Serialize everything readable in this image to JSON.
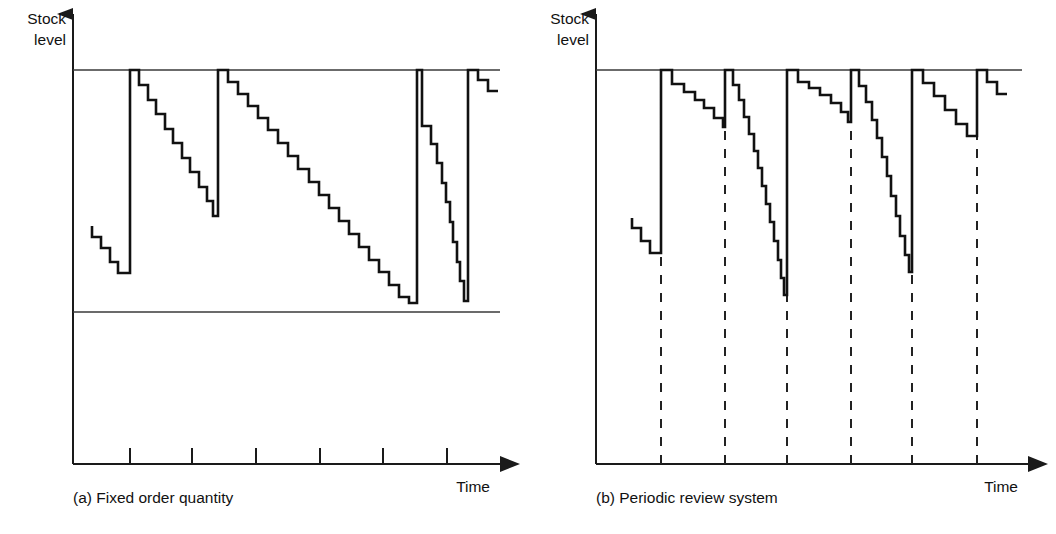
{
  "figure": {
    "background": "#ffffff",
    "ink": "#111111",
    "width": 1056,
    "height": 534
  },
  "panels": [
    {
      "id": "a",
      "caption": "(a) Fixed order quantity",
      "y_axis_label_line1": "Stock",
      "y_axis_label_line2": "level",
      "x_axis_label": "Time",
      "geometry": {
        "origin_x": 73,
        "axis_y": 464,
        "axis_top_y": 14,
        "max_level_y": 70,
        "reorder_line_y": 312,
        "axis_right_x": 500,
        "ref_line_right_x": 500
      },
      "ticks_x": [
        130,
        192,
        256,
        320,
        383,
        447
      ],
      "tick_len": 16,
      "reorder_line": {
        "y": 312,
        "x_start": 73,
        "x_end": 500
      },
      "max_level_line": {
        "y": 70,
        "x_start": 73,
        "x_end": 500
      },
      "replenishment_lines_x": [
        130,
        218,
        417,
        422,
        468
      ],
      "stock_path": "M 92,226 L 92,237 L 101,237 L 101,248 L 110,248 L 110,262 L 118,262 L 118,273 L 130,273 L 130,70 L 139,70 L 139,85 L 148,85 L 148,100 L 156,100 L 156,114 L 165,114 L 165,129 L 173,129 L 173,143 L 182,143 L 182,158 L 190,158 L 190,172 L 199,172 L 199,187 L 207,187 L 207,201 L 213,201 L 213,216 L 218,216 L 218,70 L 228,70 L 228,82 L 238,82 L 238,94 L 248,94 L 248,106 L 258,106 L 258,118 L 268,118 L 268,130 L 278,130 L 278,143 L 288,143 L 288,156 L 298,156 L 298,169 L 309,169 L 309,182 L 319,182 L 319,195 L 329,195 L 329,208 L 339,208 L 339,221 L 349,221 L 349,234 L 359,234 L 359,247 L 369,247 L 369,260 L 379,260 L 379,272 L 389,272 L 389,285 L 399,285 L 399,297 L 409,297 L 409,303 L 417,303 L 417,70 L 422,70 L 422,126 L 431,126 L 431,144 L 437,144 L 437,163 L 442,163 L 442,183 L 446,183 L 446,202 L 450,202 L 450,222 L 453,222 L 453,242 L 457,242 L 457,262 L 460,262 L 460,281 L 464,281 L 464,301 L 468,301 L 468,70 L 478,70 L 478,80 L 488,80 L 488,91 L 498,91",
      "steps_note": "sawtooth staircase demand with vertical replenishments to max level"
    },
    {
      "id": "b",
      "caption": "(b) Periodic review system",
      "y_axis_label_line1": "Stock",
      "y_axis_label_line2": "level",
      "x_axis_label": "Time",
      "geometry": {
        "origin_x": 596,
        "axis_y": 464,
        "axis_top_y": 14,
        "max_level_y": 70,
        "axis_right_x": 1028,
        "ref_line_right_x": 1022
      },
      "review_lines_x": [
        661,
        725,
        787,
        851,
        912,
        977
      ],
      "review_line_top_y": 70,
      "max_level_line": {
        "y": 70,
        "x_start": 596,
        "x_end": 1022
      },
      "stock_path": "M 632,218 L 632,228 L 641,228 L 641,241 L 650,241 L 650,253 L 661,253 L 661,70 L 672,70 L 672,84 L 684,84 L 684,92 L 695,92 L 695,100 L 704,100 L 704,108 L 714,108 L 714,118 L 723,118 L 723,127 L 725,127 L 725,70 L 733,70 L 733,85 L 739,85 L 739,100 L 744,100 L 744,117 L 749,117 L 749,134 L 754,134 L 754,151 L 758,151 L 758,168 L 762,168 L 762,186 L 766,186 L 766,204 L 770,204 L 770,222 L 774,222 L 774,241 L 778,241 L 778,260 L 781,260 L 781,278 L 784,278 L 784,295 L 787,295 L 787,70 L 798,70 L 798,82 L 809,82 L 809,88 L 820,88 L 820,95 L 831,95 L 831,103 L 841,103 L 841,112 L 848,112 L 848,122 L 851,122 L 851,70 L 859,70 L 859,86 L 866,86 L 866,102 L 872,102 L 872,120 L 877,120 L 877,138 L 882,138 L 882,157 L 887,157 L 887,176 L 891,176 L 891,196 L 896,196 L 896,216 L 900,216 L 900,236 L 905,236 L 905,255 L 909,255 L 909,272 L 912,272 L 912,70 L 923,70 L 923,83 L 934,83 L 934,96 L 945,96 L 945,110 L 956,110 L 956,124 L 967,124 L 967,136 L 977,136 L 977,70 L 987,70 L 987,82 L 997,82 L 997,94 L 1007,94",
      "steps_note": "staircase demand replenished at fixed review intervals"
    }
  ],
  "icons": {
    "arrow_head": "arrow-head-icon"
  }
}
